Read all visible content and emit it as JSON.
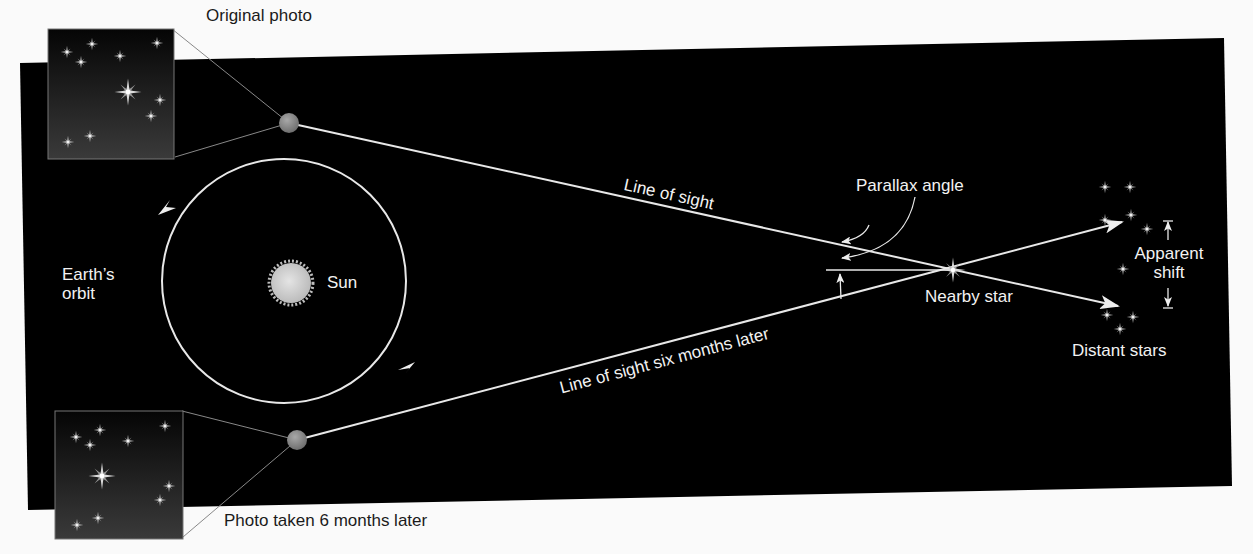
{
  "diagram": {
    "colors": {
      "background": "#fafafa",
      "space": "#000000",
      "line": "#e8e8e8",
      "earth": "#8a8a8a",
      "sun": "#cfcfcf",
      "photo_top": "#050505",
      "photo_bottom": "#3a3a3a"
    },
    "labels": {
      "original_photo": "Original photo",
      "photo_later": "Photo taken 6 months later",
      "earths_orbit_line1": "Earth’s",
      "earths_orbit_line2": "orbit",
      "sun": "Sun",
      "line_of_sight": "Line of sight",
      "line_of_sight_later": "Line of sight six months later",
      "parallax_angle": "Parallax angle",
      "nearby_star": "Nearby star",
      "apparent_shift_line1": "Apparent",
      "apparent_shift_line2": "shift",
      "distant_stars": "Distant stars"
    },
    "nodes": [
      {
        "id": "sun",
        "label": "Sun"
      },
      {
        "id": "earth-original",
        "label": "Earth (original position)"
      },
      {
        "id": "earth-6-months",
        "label": "Earth (six months later)"
      },
      {
        "id": "nearby-star",
        "label": "Nearby star"
      },
      {
        "id": "distant-stars",
        "label": "Distant stars"
      }
    ],
    "edges": [
      {
        "from": "earth-original",
        "to": "distant-stars",
        "label": "Line of sight"
      },
      {
        "from": "earth-6-months",
        "to": "distant-stars",
        "label": "Line of sight six months later"
      }
    ]
  }
}
